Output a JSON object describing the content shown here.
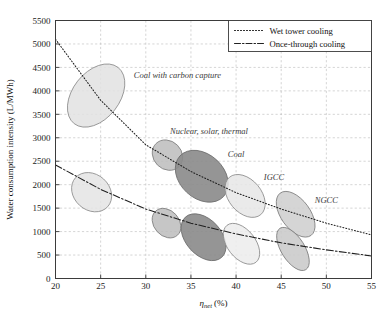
{
  "chart_data": {
    "type": "scatter",
    "title": "",
    "xlabel": "ηnet (%)",
    "xlabel_base": "η",
    "xlabel_sub": "net",
    "xlabel_unit": "(%)",
    "ylabel": "Water consumption intensity (L/MWh)",
    "xlim": [
      20,
      55
    ],
    "ylim": [
      0,
      5500
    ],
    "xticks": [
      20,
      25,
      30,
      35,
      40,
      45,
      50,
      55
    ],
    "yticks": [
      0,
      500,
      1000,
      1500,
      2000,
      2500,
      3000,
      3500,
      4000,
      4500,
      5000,
      5500
    ],
    "grid": "dashed both axes",
    "legend_position": "top-right",
    "legend": [
      {
        "label": "Wet tower cooling",
        "style": "dotted",
        "color": "#222222"
      },
      {
        "label": "Once-through cooling",
        "style": "dash-dot",
        "color": "#222222"
      }
    ],
    "series": [
      {
        "name": "Wet tower cooling",
        "style": "dotted",
        "x": [
          20,
          25,
          30,
          35,
          40,
          45,
          50,
          55
        ],
        "y": [
          5100,
          3800,
          2850,
          2280,
          1830,
          1480,
          1180,
          930
        ]
      },
      {
        "name": "Once-through cooling",
        "style": "dash-dot",
        "x": [
          20,
          25,
          30,
          35,
          40,
          45,
          50,
          55
        ],
        "y": [
          2420,
          1900,
          1480,
          1180,
          950,
          760,
          610,
          480
        ]
      }
    ],
    "annotations": [
      {
        "text": "Coal with carbon capture",
        "x": 33.5,
        "y": 4270
      },
      {
        "text": "Nuclear, solar, thermal",
        "x": 37.0,
        "y": 3070
      },
      {
        "text": "Coal",
        "x": 40.0,
        "y": 2600
      },
      {
        "text": "IGCC",
        "x": 44.2,
        "y": 2100
      },
      {
        "text": "NGCC",
        "x": 50.0,
        "y": 1620
      }
    ],
    "ellipses": [
      {
        "label": "Coal with carbon capture (wet tower)",
        "cx": 24.5,
        "cy": 3900,
        "rx": 2.6,
        "ry": 760,
        "angle": -52,
        "fill": "#e2e2e2",
        "opacity": 0.85,
        "stroke": "#8c8c8c"
      },
      {
        "label": "Coal with carbon capture (once-through)",
        "cx": 24.0,
        "cy": 1840,
        "rx": 2.4,
        "ry": 380,
        "angle": -48,
        "fill": "#e4e4e4",
        "opacity": 0.85,
        "stroke": "#8c8c8c"
      },
      {
        "label": "Nuclear, solar, thermal (wet tower)",
        "cx": 32.4,
        "cy": 2630,
        "rx": 1.8,
        "ry": 300,
        "angle": -45,
        "fill": "#bcbcbc",
        "opacity": 0.85,
        "stroke": "#7d7d7d"
      },
      {
        "label": "Nuclear, solar, thermal (once-through)",
        "cx": 32.3,
        "cy": 1180,
        "rx": 1.8,
        "ry": 270,
        "angle": -42,
        "fill": "#bcbcbc",
        "opacity": 0.85,
        "stroke": "#7d7d7d"
      },
      {
        "label": "Coal (wet tower)",
        "cx": 36.2,
        "cy": 2180,
        "rx": 3.3,
        "ry": 470,
        "angle": -47,
        "fill": "#8a8a8a",
        "opacity": 0.9,
        "stroke": "#6a6a6a"
      },
      {
        "label": "Coal (once-through)",
        "cx": 36.4,
        "cy": 880,
        "rx": 3.0,
        "ry": 380,
        "angle": -42,
        "fill": "#8a8a8a",
        "opacity": 0.9,
        "stroke": "#6a6a6a"
      },
      {
        "label": "IGCC (wet tower)",
        "cx": 41.0,
        "cy": 1760,
        "rx": 2.7,
        "ry": 350,
        "angle": -40,
        "fill": "#e6e6e6",
        "opacity": 0.85,
        "stroke": "#8c8c8c"
      },
      {
        "label": "IGCC (once-through)",
        "cx": 40.6,
        "cy": 740,
        "rx": 2.6,
        "ry": 300,
        "angle": -38,
        "fill": "#ececec",
        "opacity": 0.85,
        "stroke": "#8c8c8c"
      },
      {
        "label": "NGCC (wet tower)",
        "cx": 46.6,
        "cy": 1370,
        "rx": 2.9,
        "ry": 310,
        "angle": -36,
        "fill": "#cfcfcf",
        "opacity": 0.88,
        "stroke": "#7d7d7d"
      },
      {
        "label": "NGCC (once-through)",
        "cx": 46.3,
        "cy": 630,
        "rx": 2.7,
        "ry": 250,
        "angle": -32,
        "fill": "#c9c9c9",
        "opacity": 0.88,
        "stroke": "#7d7d7d"
      }
    ]
  }
}
